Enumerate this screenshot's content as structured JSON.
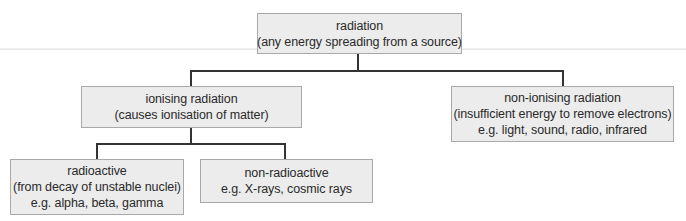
{
  "diagram": {
    "type": "tree",
    "root": {
      "title": "radiation",
      "subtitle": "(any energy spreading from a source)"
    },
    "ionising": {
      "title": "ionising radiation",
      "subtitle": "(causes ionisation of matter)"
    },
    "non_ionising": {
      "title": "non-ionising radiation",
      "subtitle": "(insufficient energy to remove electrons)",
      "examples": "e.g. light, sound, radio, infrared"
    },
    "radioactive": {
      "title": "radioactive",
      "subtitle": "(from decay of unstable nuclei)",
      "examples": "e.g. alpha, beta, gamma"
    },
    "non_radioactive": {
      "title": "non-radioactive",
      "examples": "e.g. X-rays, cosmic rays"
    },
    "colors": {
      "box_fill": "#ececec",
      "box_border": "#a9a9a9",
      "connector": "#333333",
      "text": "#2a2a2a"
    }
  }
}
